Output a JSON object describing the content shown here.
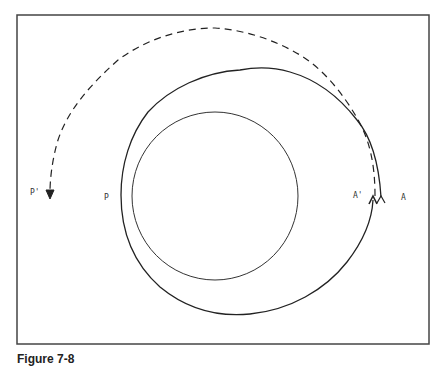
{
  "figure": {
    "caption": "Figure 7-8",
    "labels": {
      "p_prime": "P'",
      "p": "P",
      "a_prime": "A'",
      "a": "A"
    },
    "elements": [
      {
        "type": "frame",
        "description": "rectangular border"
      },
      {
        "type": "circle",
        "description": "inner central body circle"
      },
      {
        "type": "solid-spiral",
        "description": "orbit starting at A, passing through P, returning to A' with arrowhead"
      },
      {
        "type": "dashed-arc",
        "description": "dashed arc from A' over the top ending at P' with downward arrowhead"
      }
    ],
    "colors": {
      "stroke": "#2a2a2a",
      "frame": "#444444",
      "background": "#ffffff"
    }
  }
}
